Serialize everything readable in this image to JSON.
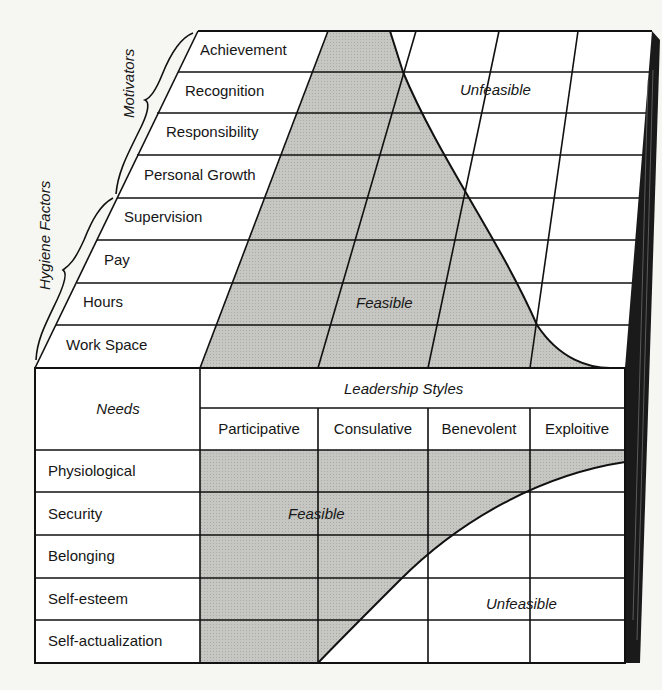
{
  "top_grid": {
    "group_labels": {
      "motivators": "Motivators",
      "hygiene": "Hygiene Factors"
    },
    "rows": [
      {
        "label": "Achievement",
        "group": "motivators"
      },
      {
        "label": "Recognition",
        "group": "motivators"
      },
      {
        "label": "Responsibility",
        "group": "motivators"
      },
      {
        "label": "Personal Growth",
        "group": "motivators"
      },
      {
        "label": "Supervision",
        "group": "hygiene"
      },
      {
        "label": "Pay",
        "group": "hygiene"
      },
      {
        "label": "Hours",
        "group": "hygiene"
      },
      {
        "label": "Work Space",
        "group": "hygiene"
      }
    ],
    "region_labels": {
      "feasible": "Feasible",
      "unfeasible": "Unfeasible"
    }
  },
  "bottom_table": {
    "row_header": "Needs",
    "column_group_header": "Leadership Styles",
    "columns": [
      "Participative",
      "Consulative",
      "Benevolent",
      "Exploitive"
    ],
    "rows": [
      "Physiological",
      "Security",
      "Belonging",
      "Self-esteem",
      "Self-actualization"
    ],
    "region_labels": {
      "feasible": "Feasible",
      "unfeasible": "Unfeasible"
    }
  },
  "colors": {
    "feasible_fill": "#c4c4c0",
    "unfeasible_fill": "#ffffff",
    "line": "#111111",
    "background": "#f6f6f3"
  }
}
